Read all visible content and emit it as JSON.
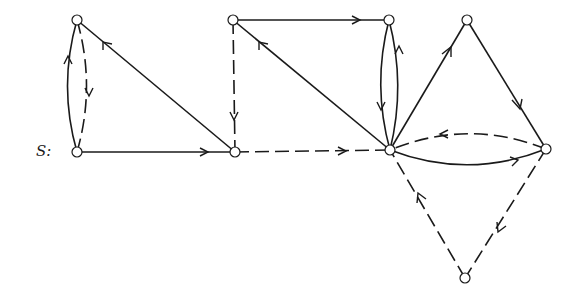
{
  "diagram": {
    "label": "S:",
    "nodes": [
      {
        "id": "A",
        "x": 77,
        "y": 20
      },
      {
        "id": "S",
        "x": 77,
        "y": 152
      },
      {
        "id": "B",
        "x": 235,
        "y": 152
      },
      {
        "id": "C",
        "x": 233,
        "y": 20
      },
      {
        "id": "D",
        "x": 389,
        "y": 20
      },
      {
        "id": "E",
        "x": 390,
        "y": 150
      },
      {
        "id": "F",
        "x": 467,
        "y": 20
      },
      {
        "id": "G",
        "x": 546,
        "y": 149
      },
      {
        "id": "H",
        "x": 465,
        "y": 278
      }
    ],
    "edges": [
      {
        "from": "S",
        "to": "A",
        "style": "solid",
        "curve": "left"
      },
      {
        "from": "A",
        "to": "S",
        "style": "dashed",
        "curve": "right"
      },
      {
        "from": "B",
        "to": "A",
        "style": "solid"
      },
      {
        "from": "S",
        "to": "B",
        "style": "solid"
      },
      {
        "from": "C",
        "to": "B",
        "style": "dashed"
      },
      {
        "from": "C",
        "to": "D",
        "style": "solid"
      },
      {
        "from": "E",
        "to": "C",
        "style": "solid"
      },
      {
        "from": "B",
        "to": "E",
        "style": "dashed"
      },
      {
        "from": "D",
        "to": "E",
        "style": "solid",
        "curve": "left"
      },
      {
        "from": "E",
        "to": "D",
        "style": "solid",
        "curve": "right"
      },
      {
        "from": "E",
        "to": "F",
        "style": "solid"
      },
      {
        "from": "F",
        "to": "G",
        "style": "solid"
      },
      {
        "from": "G",
        "to": "E",
        "style": "dashed",
        "curve": "up"
      },
      {
        "from": "E",
        "to": "G",
        "style": "solid",
        "curve": "down"
      },
      {
        "from": "G",
        "to": "H",
        "style": "dashed"
      },
      {
        "from": "H",
        "to": "E",
        "style": "dashed"
      }
    ]
  }
}
